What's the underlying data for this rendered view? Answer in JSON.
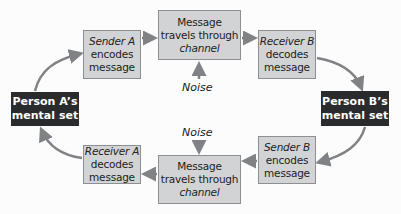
{
  "diagram": {
    "title": "",
    "nodes": {
      "person_a": {
        "line1": "Person A’s",
        "line2": "mental set"
      },
      "person_b": {
        "line1": "Person B’s",
        "line2": "mental set"
      },
      "sender_a": {
        "role": "Sender A",
        "line2": "encodes",
        "line3": "message"
      },
      "receiver_b": {
        "role": "Receiver B",
        "line2": "decodes",
        "line3": "message"
      },
      "channel_top": {
        "line1": "Message",
        "line2": "travels through",
        "line3": "channel"
      },
      "sender_b": {
        "role": "Sender B",
        "line2": "encodes",
        "line3": "message"
      },
      "receiver_a": {
        "role": "Receiver A",
        "line2": "decodes",
        "line3": "message"
      },
      "channel_bottom": {
        "line1": "Message",
        "line2": "travels through",
        "line3": "channel"
      }
    },
    "noise_top": "Noise",
    "noise_bottom": "Noise",
    "colors": {
      "box_fill": "#d2d3d5",
      "box_border": "#8e8f92",
      "dark_fill": "#2a2b2d",
      "arrow": "#808285"
    }
  }
}
